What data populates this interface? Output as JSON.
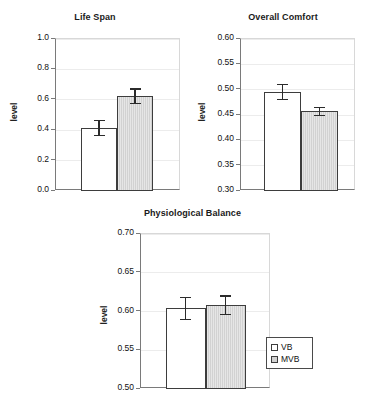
{
  "figure": {
    "legend": {
      "entries": [
        {
          "label": "VB",
          "swatch": "white"
        },
        {
          "label": "MVB",
          "swatch": "gray"
        }
      ]
    }
  },
  "chart_data": [
    {
      "type": "bar",
      "title": "Life Span",
      "xlabel": "",
      "ylabel": "level",
      "categories": [
        "VB",
        "MVB"
      ],
      "values": [
        0.415,
        0.623
      ],
      "errors": [
        0.055,
        0.053
      ],
      "ylim": [
        0.0,
        1.0
      ],
      "yticks": [
        "0.0",
        "0.2",
        "0.4",
        "0.6",
        "0.8",
        "1.0"
      ],
      "ytick_values": [
        0.0,
        0.2,
        0.4,
        0.6,
        0.8,
        1.0
      ],
      "grid": true,
      "legend_position": "none"
    },
    {
      "type": "bar",
      "title": "Overall Comfort",
      "xlabel": "",
      "ylabel": "level",
      "categories": [
        "VB",
        "MVB"
      ],
      "values": [
        0.495,
        0.457
      ],
      "errors": [
        0.016,
        0.009
      ],
      "ylim": [
        0.3,
        0.6
      ],
      "yticks": [
        "0.30",
        "0.35",
        "0.40",
        "0.45",
        "0.50",
        "0.55",
        "0.60"
      ],
      "ytick_values": [
        0.3,
        0.35,
        0.4,
        0.45,
        0.5,
        0.55,
        0.6
      ],
      "grid": true,
      "legend_position": "none"
    },
    {
      "type": "bar",
      "title": "Physiological Balance",
      "xlabel": "",
      "ylabel": "level",
      "categories": [
        "VB",
        "MVB"
      ],
      "values": [
        0.604,
        0.608
      ],
      "errors": [
        0.015,
        0.013
      ],
      "ylim": [
        0.5,
        0.7
      ],
      "yticks": [
        "0.50",
        "0.55",
        "0.60",
        "0.65",
        "0.70"
      ],
      "ytick_values": [
        0.5,
        0.55,
        0.6,
        0.65,
        0.7
      ],
      "grid": true,
      "legend_position": "right"
    }
  ]
}
